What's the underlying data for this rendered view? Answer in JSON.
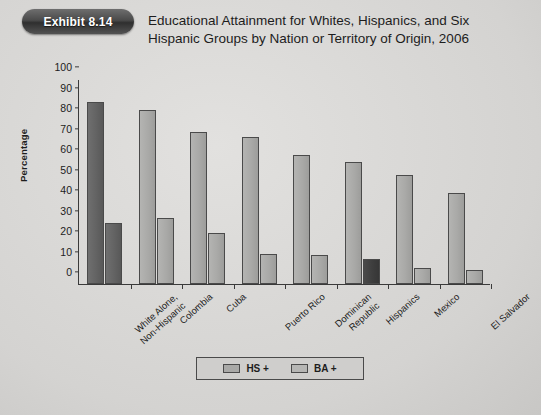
{
  "exhibit": {
    "badge_label": "Exhibit 8.14"
  },
  "title": {
    "line1": "Educational Attainment for Whites, Hispanics, and Six",
    "line2": "Hispanic Groups by Nation or Territory of Origin, 2006"
  },
  "legend": {
    "items": [
      {
        "label": "HS +",
        "swatch": "hs"
      },
      {
        "label": "BA +",
        "swatch": "ba"
      }
    ]
  },
  "colors": {
    "bar_light": "#a9a9a7",
    "bar_dark": "#636363",
    "bar_darkest": "#3e3e3e",
    "axis": "#3a3a3a",
    "text": "#1d1d1d",
    "badge": "#4a4a4a",
    "background": "#d8d8d6"
  },
  "chart_data": {
    "type": "bar",
    "title": "Educational Attainment for Whites, Hispanics, and Six Hispanic Groups by Nation or Territory of Origin, 2006",
    "xlabel": "",
    "ylabel": "Percentage",
    "ylim": [
      0,
      100
    ],
    "yticks": [
      0,
      10,
      20,
      30,
      40,
      50,
      60,
      70,
      80,
      90,
      100
    ],
    "grid": false,
    "legend_position": "bottom",
    "categories": [
      "White Alone,\nNon-Hispanic",
      "Colombia",
      "Cuba",
      "Puerto Rico",
      "Dominican\nRepublic",
      "Hispanics",
      "Mexico",
      "El Salvador"
    ],
    "category_labels": [
      {
        "line1": "White Alone,",
        "line2": "Non-Hispanic"
      },
      {
        "line1": "Colombia",
        "line2": ""
      },
      {
        "line1": "Cuba",
        "line2": ""
      },
      {
        "line1": "Puerto Rico",
        "line2": ""
      },
      {
        "line1": "Dominican",
        "line2": "Republic"
      },
      {
        "line1": "Hispanics",
        "line2": ""
      },
      {
        "line1": "Mexico",
        "line2": ""
      },
      {
        "line1": "El Salvador",
        "line2": ""
      }
    ],
    "series": [
      {
        "name": "HS +",
        "values": [
          89,
          85,
          74,
          71.5,
          63,
          59.5,
          53,
          44.5
        ]
      },
      {
        "name": "BA +",
        "values": [
          30,
          32,
          25,
          14.5,
          14,
          12,
          8,
          7
        ]
      }
    ]
  }
}
